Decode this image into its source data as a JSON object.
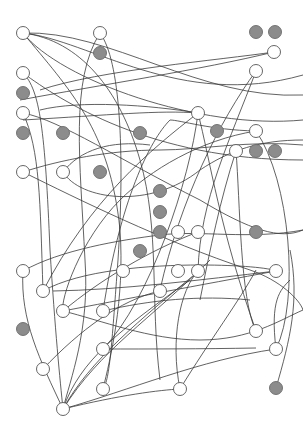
{
  "diagram": {
    "type": "network-graph",
    "width": 303,
    "height": 432,
    "node_radius": 6.5,
    "colors": {
      "background": "#ffffff",
      "edge": "#3a3a3a",
      "open_fill": "#ffffff",
      "open_stroke": "#555555",
      "filled_fill": "#8c8c8c",
      "filled_stroke": "#6a6a6a"
    },
    "open_nodes": [
      [
        23,
        33
      ],
      [
        100,
        33
      ],
      [
        274,
        52
      ],
      [
        23,
        73
      ],
      [
        256,
        71
      ],
      [
        23,
        113
      ],
      [
        198,
        113
      ],
      [
        256,
        131
      ],
      [
        236,
        151
      ],
      [
        23,
        172
      ],
      [
        63,
        172
      ],
      [
        178,
        232
      ],
      [
        198,
        232
      ],
      [
        23,
        271
      ],
      [
        123,
        271
      ],
      [
        178,
        271
      ],
      [
        198,
        271
      ],
      [
        276,
        271
      ],
      [
        43,
        291
      ],
      [
        160,
        291
      ],
      [
        63,
        311
      ],
      [
        103,
        311
      ],
      [
        256,
        331
      ],
      [
        103,
        349
      ],
      [
        276,
        349
      ],
      [
        43,
        369
      ],
      [
        103,
        389
      ],
      [
        180,
        389
      ],
      [
        63,
        409
      ]
    ],
    "filled_nodes": [
      [
        256,
        32
      ],
      [
        275,
        32
      ],
      [
        100,
        53
      ],
      [
        23,
        93
      ],
      [
        23,
        133
      ],
      [
        63,
        133
      ],
      [
        140,
        133
      ],
      [
        217,
        131
      ],
      [
        100,
        172
      ],
      [
        256,
        151
      ],
      [
        275,
        151
      ],
      [
        160,
        191
      ],
      [
        160,
        212
      ],
      [
        160,
        232
      ],
      [
        140,
        251
      ],
      [
        256,
        232
      ],
      [
        23,
        329
      ],
      [
        276,
        388
      ]
    ],
    "edges": [
      "M23,33 C90,40 180,110 303,75",
      "M23,33 C110,30 200,100 303,95",
      "M23,33 C60,80 200,130 303,120",
      "M23,33 C80,40 120,90 140,160 C160,230 150,300 160,380",
      "M23,33 C70,90 110,130 120,230 C125,300 110,360 103,389",
      "M100,33 C70,80 80,160 85,260 C90,330 70,380 63,409",
      "M100,33 C120,60 125,150 118,260 C112,340 110,380 103,389",
      "M23,73 C60,100 150,160 303,160",
      "M23,73 C40,90 45,130 50,250 C55,330 60,380 63,409",
      "M23,113 C60,120 120,160 200,200 C250,230 280,240 303,230",
      "M23,113 C40,150 40,200 43,291",
      "M274,52 C220,60 100,70 40,90",
      "M274,52 C200,70 100,85 20,100",
      "M256,71 C220,120 180,200 160,290",
      "M256,71 C230,140 200,200 198,271",
      "M198,113 C150,105 80,100 40,110",
      "M198,113 C160,110 110,115 23,120",
      "M198,113 C150,150 90,200 43,291",
      "M198,113 C190,180 150,300 103,349",
      "M198,113 C210,160 220,230 256,331",
      "M256,131 C210,130 180,120 170,120 C150,140 120,200 103,311",
      "M256,131 C200,140 150,170 120,200 C80,240 60,300 63,311",
      "M256,131 C290,180 300,300 276,349",
      "M236,151 C220,200 210,250 200,300",
      "M236,151 C240,200 240,300 256,331",
      "M23,172 C60,160 110,150 160,150 C200,150 250,140 303,145",
      "M23,172 C80,200 160,240 250,270 C280,280 300,300 303,310",
      "M63,172 C80,150 110,140 150,145",
      "M63,172 C80,200 150,210 200,170 C230,150 260,140 303,140",
      "M23,271 C60,250 120,240 160,235 C200,230 250,240 303,230",
      "M23,271 C20,320 40,360 63,409",
      "M43,291 C80,270 150,265 200,265 C240,265 270,268 276,271",
      "M53,291 C120,290 200,280 276,271",
      "M63,311 C120,300 200,285 276,271",
      "M63,311 C100,320 150,340 200,340 C250,340 280,320 303,310",
      "M63,311 C100,280 150,250 198,232",
      "M103,311 C150,300 200,295 250,300",
      "M103,349 C150,349 200,349 256,348",
      "M43,369 C80,330 120,300 160,291",
      "M63,409 C80,360 120,330 190,280",
      "M63,409 C90,360 140,320 200,270",
      "M63,409 C100,350 150,320 210,260",
      "M63,409 C120,395 160,390 180,389",
      "M63,409 C130,390 200,360 276,349",
      "M180,389 C170,340 180,290 198,271",
      "M180,389 C210,340 240,300 256,270",
      "M276,349 C270,300 280,290 290,280",
      "M276,388 C290,340 300,300 290,250"
    ]
  }
}
